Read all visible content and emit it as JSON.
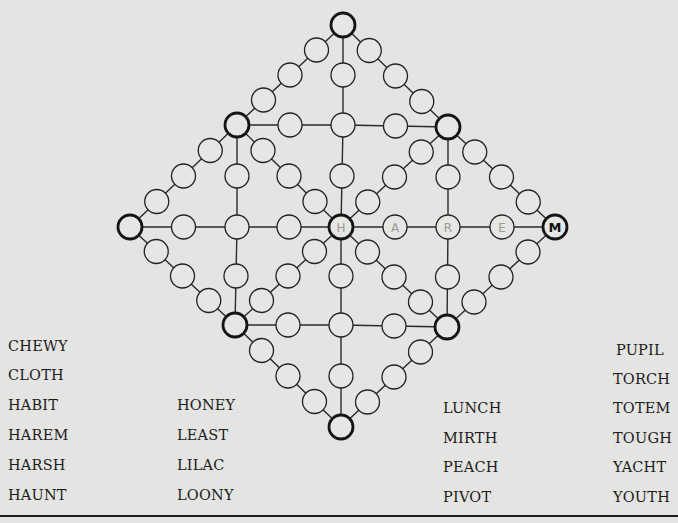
{
  "puzzle": {
    "type": "diamond word-fill grid",
    "filled_letters": {
      "center_hub": "H",
      "right_row_1": "A",
      "right_row_2": "R",
      "right_row_3": "E",
      "right_vertex": "M"
    },
    "filled_word": "HAREM"
  },
  "word_list": {
    "column_1": [
      "CHEWY",
      "CLOTH",
      "HABIT",
      "HAREM",
      "HARSH",
      "HAUNT"
    ],
    "column_2": [
      "HONEY",
      "LEAST",
      "LILAC",
      "LOONY"
    ],
    "column_3": [
      "LUNCH",
      "MIRTH",
      "PEACH",
      "PIVOT"
    ],
    "column_4": [
      "PUPIL",
      "TORCH",
      "TOTEM",
      "TOUGH",
      "YACHT",
      "YOUTH"
    ]
  }
}
